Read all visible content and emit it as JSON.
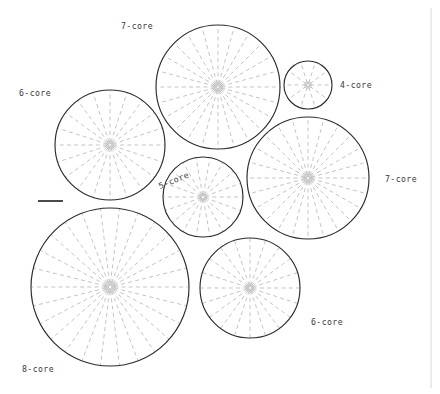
{
  "figure": {
    "background_color": "#ffffff",
    "outline_color": "#2b2b2b",
    "spoke_color": "#b9b9b9",
    "label_color": "#3a3a3a",
    "width": 440,
    "height": 394
  },
  "scale_bar": {
    "name": "scale-bar",
    "x1": 38,
    "y1": 201,
    "x2": 63,
    "y2": 201
  },
  "frame": {
    "right_border_x": 431
  },
  "chart_data": {
    "type": "scatter",
    "xlabel": "",
    "ylabel": "",
    "xlim": [
      0,
      440
    ],
    "ylim": [
      0,
      394
    ],
    "grid": false,
    "legend": "none",
    "units": "pixels",
    "series": [
      {
        "name": "packed-circles",
        "points": [
          {
            "id": "circle-7core-top",
            "label": "7-core",
            "cores": 7,
            "cx": 218,
            "cy": 87,
            "r": 62,
            "spokes": 24,
            "label_x": 121,
            "label_y": 29,
            "label_rotation": 0
          },
          {
            "id": "circle-6core-left",
            "label": "6-core",
            "cores": 6,
            "cx": 110,
            "cy": 145,
            "r": 55,
            "spokes": 20,
            "label_x": 19,
            "label_y": 96,
            "label_rotation": 0
          },
          {
            "id": "circle-4core-topright",
            "label": "4-core",
            "cores": 4,
            "cx": 308,
            "cy": 85,
            "r": 24,
            "spokes": 10,
            "label_x": 340,
            "label_y": 88,
            "label_rotation": 0
          },
          {
            "id": "circle-7core-right",
            "label": "7-core",
            "cores": 7,
            "cx": 308,
            "cy": 178,
            "r": 61,
            "spokes": 24,
            "label_x": 385,
            "label_y": 182,
            "label_rotation": 0
          },
          {
            "id": "circle-5core-center",
            "label": "5-core",
            "cores": 5,
            "cx": 203,
            "cy": 197,
            "r": 40,
            "spokes": 18,
            "label_x": 160,
            "label_y": 189,
            "label_rotation": -22
          },
          {
            "id": "circle-8core-bottomleft",
            "label": "8-core",
            "cores": 8,
            "cx": 110,
            "cy": 287,
            "r": 79,
            "spokes": 26,
            "label_x": 22,
            "label_y": 372,
            "label_rotation": 0
          },
          {
            "id": "circle-6core-bottomright",
            "label": "6-core",
            "cores": 6,
            "cx": 250,
            "cy": 288,
            "r": 50,
            "spokes": 20,
            "label_x": 311,
            "label_y": 325,
            "label_rotation": 0
          }
        ]
      }
    ]
  }
}
